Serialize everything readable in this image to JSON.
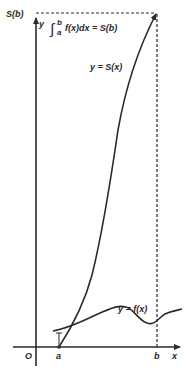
{
  "diagram": {
    "colors": {
      "ink": "#2a2a2a",
      "background": "#ffffff"
    },
    "axes": {
      "origin_label": "O",
      "x_axis_label": "x",
      "y_axis_label": "y",
      "x_ticks": [
        "a",
        "b"
      ],
      "y_tick": "S(b)"
    },
    "annotations": {
      "integral_prefix": "∫",
      "integral_upper": "b",
      "integral_lower": "a",
      "integral_body": "f(x)dx = S(b)",
      "curve_S_label": "y = S(x)",
      "curve_f_label": "y = f(x)"
    },
    "curves": [
      {
        "name": "S(x)",
        "style": "solid",
        "description": "antiderivative rising from (a,0) to (b,S(b))"
      },
      {
        "name": "f(x)",
        "style": "solid",
        "description": "wavy positive function near x-axis"
      }
    ],
    "guides": [
      {
        "name": "horizontal-dashed",
        "from": "y-axis at S(b)",
        "to": "point (b,S(b))"
      },
      {
        "name": "vertical-dashed",
        "from": "point (b,S(b))",
        "to": "x-axis at b"
      }
    ]
  }
}
